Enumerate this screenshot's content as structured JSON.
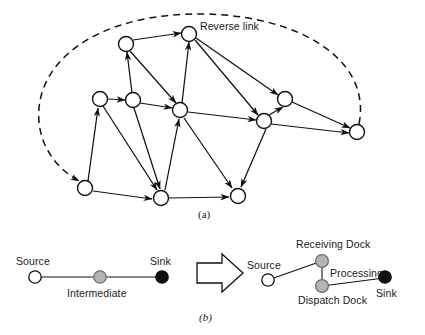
{
  "figure": {
    "title_a_caption": "(a)",
    "title_b_caption": "(b)",
    "annotations": {
      "reverse_link": "Reverse link"
    },
    "panel_a": {
      "type": "directed-network-graph",
      "node_count": 11,
      "nodes": [
        {
          "id": "n1",
          "x": 126,
          "y": 44,
          "fill": "#ffffff"
        },
        {
          "id": "n2",
          "x": 189,
          "y": 34,
          "fill": "#ffffff"
        },
        {
          "id": "n3",
          "x": 100,
          "y": 99,
          "fill": "#ffffff"
        },
        {
          "id": "n4",
          "x": 133,
          "y": 100,
          "fill": "#ffffff"
        },
        {
          "id": "n5",
          "x": 180,
          "y": 110,
          "fill": "#ffffff"
        },
        {
          "id": "n6",
          "x": 285,
          "y": 99,
          "fill": "#ffffff"
        },
        {
          "id": "n7",
          "x": 264,
          "y": 121,
          "fill": "#ffffff"
        },
        {
          "id": "n8",
          "x": 357,
          "y": 132,
          "fill": "#ffffff"
        },
        {
          "id": "n9",
          "x": 85,
          "y": 188,
          "fill": "#ffffff"
        },
        {
          "id": "n10",
          "x": 161,
          "y": 198,
          "fill": "#ffffff"
        },
        {
          "id": "n11",
          "x": 238,
          "y": 196,
          "fill": "#ffffff"
        }
      ],
      "edges": [
        {
          "from": "n1",
          "to": "n2"
        },
        {
          "from": "n1",
          "to": "n5"
        },
        {
          "from": "n4",
          "to": "n1"
        },
        {
          "from": "n3",
          "to": "n4"
        },
        {
          "from": "n4",
          "to": "n5"
        },
        {
          "from": "n5",
          "to": "n2"
        },
        {
          "from": "n2",
          "to": "n6"
        },
        {
          "from": "n2",
          "to": "n7"
        },
        {
          "from": "n5",
          "to": "n7"
        },
        {
          "from": "n7",
          "to": "n6"
        },
        {
          "from": "n6",
          "to": "n8"
        },
        {
          "from": "n7",
          "to": "n8"
        },
        {
          "from": "n9",
          "to": "n3"
        },
        {
          "from": "n9",
          "to": "n10"
        },
        {
          "from": "n3",
          "to": "n10"
        },
        {
          "from": "n4",
          "to": "n10"
        },
        {
          "from": "n10",
          "to": "n5"
        },
        {
          "from": "n5",
          "to": "n11"
        },
        {
          "from": "n10",
          "to": "n11"
        },
        {
          "from": "n7",
          "to": "n11"
        }
      ],
      "reverse_link_edge": {
        "from": "n8",
        "to": "n9",
        "style": "dashed",
        "curved": true
      }
    },
    "panel_b": {
      "left_diagram": {
        "nodes": [
          {
            "label": "Source",
            "fill": "#ffffff",
            "label_position": "above-left"
          },
          {
            "label": "Intermediate",
            "fill": "#b5b5b5",
            "label_position": "below"
          },
          {
            "label": "Sink",
            "fill": "#111111",
            "label_position": "above"
          }
        ]
      },
      "transform_arrow": "block-arrow-right",
      "right_diagram": {
        "nodes": [
          {
            "label": "Source",
            "fill": "#ffffff",
            "label_position": "above-left"
          },
          {
            "label": "Receiving Dock",
            "fill": "#b5b5b5",
            "label_position": "above"
          },
          {
            "label": "Dispatch Dock",
            "fill": "#b5b5b5",
            "label_position": "below"
          },
          {
            "label": "Sink",
            "fill": "#111111",
            "label_position": "below"
          }
        ],
        "edge_label": "Processing"
      }
    }
  }
}
